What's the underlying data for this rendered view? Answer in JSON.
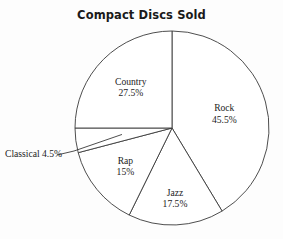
{
  "chart_data": {
    "type": "pie",
    "title": "Compact Discs Sold",
    "xlabel": "",
    "ylabel": "",
    "legend_position": "none",
    "grid": false,
    "categories": [
      "Rock",
      "Jazz",
      "Rap",
      "Classical",
      "Country"
    ],
    "values": [
      45.5,
      17.5,
      15,
      4.5,
      27.5
    ],
    "unit": "%",
    "slices": [
      {
        "label": "Rock",
        "value": 45.5,
        "percent_text": "45.5%",
        "label_placement": "inside",
        "callout": false
      },
      {
        "label": "Jazz",
        "value": 17.5,
        "percent_text": "17.5%",
        "label_placement": "inside",
        "callout": false
      },
      {
        "label": "Rap",
        "value": 15,
        "percent_text": "15%",
        "label_placement": "inside",
        "callout": false
      },
      {
        "label": "Classical",
        "value": 4.5,
        "percent_text": "4.5%",
        "label_placement": "outside",
        "callout": true
      },
      {
        "label": "Country",
        "value": 27.5,
        "percent_text": "27.5%",
        "label_placement": "inside",
        "callout": false
      }
    ],
    "start_angle_deg": 0,
    "direction": "clockwise",
    "colors": {
      "background": "#fdfdfd",
      "slice_fill": "#ffffff",
      "outline": "#3a3a3a",
      "title_text": "#1a1a1a",
      "label_text": "#1c1c1c"
    },
    "geometry": {
      "center_x": 172,
      "center_y": 128,
      "radius": 97
    }
  },
  "labels": {
    "rock": {
      "name": "Rock",
      "pct": "45.5%"
    },
    "jazz": {
      "name": "Jazz",
      "pct": "17.5%"
    },
    "rap": {
      "name": "Rap",
      "pct": "15%"
    },
    "classical": {
      "name": "Classical 4.5%"
    },
    "country": {
      "name": "Country",
      "pct": "27.5%"
    }
  }
}
